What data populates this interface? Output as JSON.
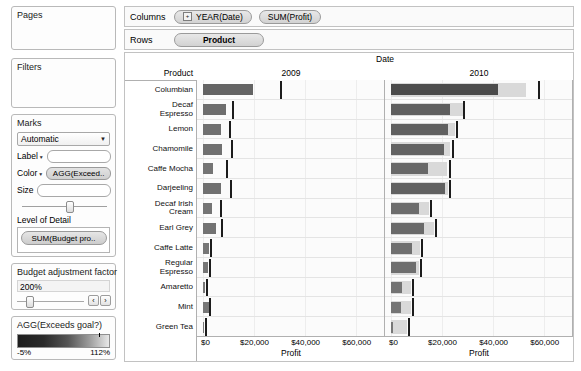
{
  "left_rail": {
    "pages": {
      "title": "Pages"
    },
    "filters": {
      "title": "Filters"
    },
    "marks": {
      "title": "Marks",
      "mark_type": "Automatic",
      "label_label": "Label",
      "label_value": "",
      "color_label": "Color",
      "color_value": "AGG(Exceed..",
      "size_label": "Size",
      "size_value": "",
      "level_of_detail_title": "Level of Detail",
      "level_of_detail_pill": "SUM(Budget pro.."
    },
    "parameter": {
      "title": "Budget adjustment factor",
      "value": "200%",
      "prev_label": "‹",
      "next_label": "›"
    },
    "legend": {
      "title": "AGG(Exceeds goal?)",
      "min_label": "-5%",
      "max_label": "112%",
      "gradient_from": "#1d1d1d",
      "gradient_to": "#e8e8e8"
    }
  },
  "shelves": {
    "columns_label": "Columns",
    "rows_label": "Rows",
    "columns_pills": [
      {
        "text": "YEAR(Date)",
        "has_plus": true,
        "plus_glyph": "+"
      },
      {
        "text": "SUM(Profit)",
        "has_plus": false,
        "plus_glyph": ""
      }
    ],
    "rows_pills": [
      {
        "text": "Product"
      }
    ]
  },
  "viz": {
    "column_group_header": "Date",
    "row_header": "Product",
    "axis_title": "Profit",
    "axis_ticks": [
      "$0",
      "$20,000",
      "$40,000",
      "$60,000"
    ],
    "axis_tick_values": [
      0,
      20000,
      40000,
      60000
    ],
    "bar_color": "#6f6f6f",
    "band_color": "#d9d9d9",
    "reference_line_color": "#1c1c1c"
  },
  "chart_data": {
    "type": "bar",
    "subtitle": "Bullet-style bar chart: bar = SUM(Profit), tick = SUM(Budget profit) × 200%, band = budget range",
    "xlabel": "Profit",
    "ylabel": "Product",
    "xlim": [
      0,
      65000
    ],
    "grid": true,
    "legend": "AGG(Exceeds goal?)",
    "legend_position": "left-panel",
    "panels": [
      "2009",
      "2010"
    ],
    "categories": [
      "Columbian",
      "Decaf Espresso",
      "Lemon",
      "Chamomile",
      "Caffe Mocha",
      "Darjeeling",
      "Decaf Irish Cream",
      "Earl Grey",
      "Caffe Latte",
      "Regular Espresso",
      "Amaretto",
      "Mint",
      "Green Tea"
    ],
    "category_lines": [
      [
        "Columbian"
      ],
      [
        "Decaf",
        "Espresso"
      ],
      [
        "Lemon"
      ],
      [
        "Chamomile"
      ],
      [
        "Caffe Mocha"
      ],
      [
        "Darjeeling"
      ],
      [
        "Decaf Irish",
        "Cream"
      ],
      [
        "Earl Grey"
      ],
      [
        "Caffe Latte"
      ],
      [
        "Regular",
        "Espresso"
      ],
      [
        "Amaretto"
      ],
      [
        "Mint"
      ],
      [
        "Green Tea"
      ]
    ],
    "series": [
      {
        "name": "2009",
        "panel": "2009",
        "values": [
          19500,
          9000,
          7200,
          7400,
          4100,
          7100,
          3600,
          5200,
          2200,
          2100,
          900,
          2300,
          300
        ],
        "reference_values": [
          30000,
          11400,
          10300,
          11000,
          9200,
          10600,
          6500,
          7100,
          2900,
          2500,
          1200,
          2500,
          900
        ],
        "band_values": [
          0,
          0,
          0,
          0,
          0,
          0,
          0,
          0,
          0,
          0,
          0,
          0,
          0
        ]
      },
      {
        "name": "2010",
        "panel": "2010",
        "values": [
          42000,
          23000,
          22500,
          20600,
          14500,
          21000,
          10800,
          12800,
          8200,
          9600,
          4200,
          4000,
          700
        ],
        "reference_values": [
          57500,
          28200,
          25600,
          23800,
          22600,
          22900,
          15200,
          17400,
          11800,
          11300,
          8300,
          8200,
          6500
        ],
        "band_values": [
          53000,
          28000,
          25000,
          23200,
          22000,
          22400,
          14800,
          17000,
          11400,
          11000,
          8000,
          7800,
          6200
        ]
      }
    ]
  }
}
